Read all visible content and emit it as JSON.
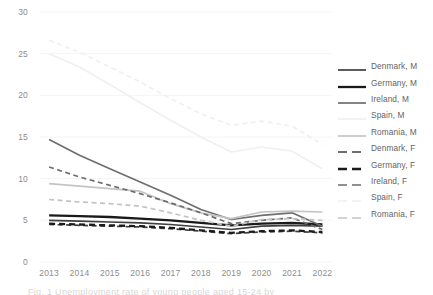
{
  "chart_data": {
    "type": "line",
    "title": "",
    "xlabel": "",
    "ylabel": "",
    "x": [
      2013,
      2014,
      2015,
      2016,
      2017,
      2018,
      2019,
      2020,
      2021,
      2022
    ],
    "xtick_labels": [
      "2013",
      "2014",
      "2015",
      "2016",
      "2017",
      "2018",
      "2019",
      "2020",
      "2021",
      "2022"
    ],
    "ytick_labels": [
      "0",
      "5",
      "10",
      "15",
      "20",
      "25",
      "30"
    ],
    "yticks": [
      0,
      5,
      10,
      15,
      20,
      25,
      30
    ],
    "ylim": [
      0,
      30
    ],
    "grid": true,
    "legend_position": "right",
    "series": [
      {
        "name": "Denmark, M",
        "country": "Denmark",
        "sex": "M",
        "color": "#3f3f3f",
        "dash": "solid",
        "width": 1.7,
        "values": [
          5.0,
          4.9,
          4.8,
          4.7,
          4.5,
          4.2,
          3.9,
          4.3,
          4.4,
          4.3
        ]
      },
      {
        "name": "Germany, M",
        "country": "Germany",
        "sex": "M",
        "color": "#1a1a1a",
        "dash": "solid",
        "width": 2.3,
        "values": [
          5.6,
          5.5,
          5.4,
          5.2,
          5.0,
          4.7,
          4.4,
          4.6,
          4.7,
          4.5
        ]
      },
      {
        "name": "Ireland, M",
        "country": "Ireland",
        "sex": "M",
        "color": "#6e6e6e",
        "dash": "solid",
        "width": 1.7,
        "values": [
          14.7,
          12.8,
          11.2,
          9.6,
          8.0,
          6.3,
          5.1,
          5.6,
          5.9,
          4.3
        ]
      },
      {
        "name": "Spain, M",
        "country": "Spain",
        "sex": "M",
        "color": "#f0f0f0",
        "dash": "solid",
        "width": 1.7,
        "values": [
          25.0,
          23.4,
          21.3,
          19.1,
          17.0,
          15.0,
          13.2,
          13.8,
          13.3,
          11.2
        ]
      },
      {
        "name": "Romania, M",
        "country": "Romania",
        "sex": "M",
        "color": "#c4c4c4",
        "dash": "solid",
        "width": 1.7,
        "values": [
          9.4,
          9.1,
          8.8,
          8.5,
          7.0,
          5.9,
          5.2,
          6.0,
          6.1,
          6.0
        ]
      },
      {
        "name": "Denmark, F",
        "country": "Denmark",
        "sex": "F",
        "color": "#3f3f3f",
        "dash": "dashed",
        "width": 1.7,
        "values": [
          4.5,
          4.4,
          4.3,
          4.2,
          4.0,
          3.7,
          3.4,
          3.6,
          3.7,
          3.5
        ]
      },
      {
        "name": "Germany, F",
        "country": "Germany",
        "sex": "F",
        "color": "#1a1a1a",
        "dash": "dashed",
        "width": 2.3,
        "values": [
          4.6,
          4.5,
          4.4,
          4.3,
          4.1,
          3.8,
          3.5,
          3.7,
          3.8,
          3.6
        ]
      },
      {
        "name": "Ireland, F",
        "country": "Ireland",
        "sex": "F",
        "color": "#6e6e6e",
        "dash": "dashed",
        "width": 1.7,
        "values": [
          11.4,
          10.2,
          9.2,
          8.2,
          7.1,
          5.9,
          4.6,
          5.0,
          5.3,
          3.9
        ]
      },
      {
        "name": "Spain, F",
        "country": "Spain",
        "sex": "F",
        "color": "#f0f0f0",
        "dash": "dashed",
        "width": 1.7,
        "values": [
          26.6,
          25.2,
          23.4,
          21.6,
          19.6,
          17.8,
          16.4,
          16.9,
          16.3,
          14.1
        ]
      },
      {
        "name": "Romania, F",
        "country": "Romania",
        "sex": "F",
        "color": "#c4c4c4",
        "dash": "dashed",
        "width": 1.7,
        "values": [
          7.5,
          7.2,
          7.0,
          6.7,
          5.9,
          5.0,
          4.3,
          5.1,
          5.2,
          5.0
        ]
      }
    ]
  },
  "legend": {
    "items": [
      {
        "label": "Denmark, M"
      },
      {
        "label": "Germany, M"
      },
      {
        "label": "Ireland, M"
      },
      {
        "label": "Spain, M"
      },
      {
        "label": "Romania, M"
      },
      {
        "label": "Denmark, F"
      },
      {
        "label": "Germany, F"
      },
      {
        "label": "Ireland, F"
      },
      {
        "label": "Spain, F"
      },
      {
        "label": "Romania, F"
      }
    ]
  },
  "caption": {
    "text": "Fig. 1 Unemployment rate of young people aged 15-24 by"
  }
}
